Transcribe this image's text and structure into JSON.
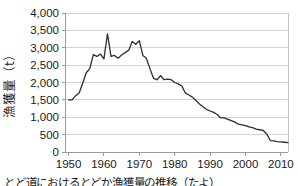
{
  "chart_data": {
    "type": "line",
    "title": "",
    "xlabel": "",
    "ylabel": "漁獲量（t）",
    "xlim": [
      1949,
      2012
    ],
    "ylim": [
      0,
      4000
    ],
    "grid": "horizontal",
    "legend": "none",
    "line_color": "#2d2d2d",
    "gridline_color": "#d4d4d4",
    "axis_color": "#9a9a9a",
    "ytick_labels": [
      "0",
      "500",
      "1,000",
      "1,500",
      "2,000",
      "2,500",
      "3,000",
      "3,500",
      "4,000"
    ],
    "ytick_values": [
      0,
      500,
      1000,
      1500,
      2000,
      2500,
      3000,
      3500,
      4000
    ],
    "xtick_labels": [
      "1950",
      "1960",
      "1970",
      "1980",
      "1990",
      "2000",
      "2010"
    ],
    "xtick_values": [
      1950,
      1960,
      1970,
      1980,
      1990,
      2000,
      2010
    ],
    "series": [
      {
        "name": "漁獲量",
        "x": [
          1950,
          1951,
          1952,
          1953,
          1954,
          1955,
          1956,
          1957,
          1958,
          1959,
          1960,
          1961,
          1962,
          1963,
          1964,
          1965,
          1966,
          1967,
          1968,
          1969,
          1970,
          1971,
          1972,
          1973,
          1974,
          1975,
          1976,
          1977,
          1978,
          1979,
          1980,
          1981,
          1982,
          1983,
          1984,
          1985,
          1986,
          1987,
          1988,
          1989,
          1990,
          1991,
          1992,
          1993,
          1994,
          1995,
          1996,
          1997,
          1998,
          1999,
          2000,
          2001,
          2002,
          2003,
          2004,
          2005,
          2006,
          2007,
          2008,
          2009,
          2010,
          2011,
          2012
        ],
        "values": [
          1500,
          1500,
          1620,
          1700,
          1980,
          2280,
          2400,
          2800,
          2750,
          2820,
          2680,
          3400,
          2750,
          2780,
          2700,
          2790,
          2860,
          2930,
          3180,
          3100,
          3200,
          2780,
          2700,
          2400,
          2120,
          2080,
          2200,
          2080,
          2100,
          2080,
          2000,
          1960,
          1900,
          1700,
          1640,
          1580,
          1480,
          1380,
          1300,
          1220,
          1180,
          1140,
          1080,
          980,
          980,
          940,
          900,
          860,
          800,
          780,
          760,
          720,
          700,
          660,
          640,
          620,
          520,
          330,
          320,
          300,
          290,
          280,
          270
        ]
      }
    ]
  },
  "caption": {
    "text": "とど道におけるとどか漁獲量の推移（たよ）"
  }
}
